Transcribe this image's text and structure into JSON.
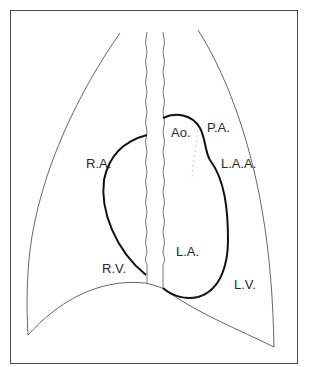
{
  "diagram": {
    "type": "chest-radiograph-cardiac-silhouette-schematic",
    "colors": {
      "background": "#ffffff",
      "frame": "#4a4a4a",
      "heart_outline": "#111111",
      "lung_outline": "#555555",
      "spine": "#666666",
      "label_text": "#2a2a2a"
    },
    "labels": {
      "ao": "Ao.",
      "pa": "P.A.",
      "laa": "L.A.A.",
      "ra": "R.A.",
      "la": "L.A.",
      "rv": "R.V.",
      "lv": "L.V."
    },
    "structures": [
      {
        "id": "lung-left-outline",
        "name": "Right lung field (patient's right)"
      },
      {
        "id": "lung-right-outline",
        "name": "Left lung field (patient's left)"
      },
      {
        "id": "spine",
        "name": "Vertebral column"
      },
      {
        "id": "heart-outline",
        "name": "Cardiac silhouette"
      },
      {
        "id": "diaphragm",
        "name": "Diaphragm dome"
      }
    ]
  }
}
